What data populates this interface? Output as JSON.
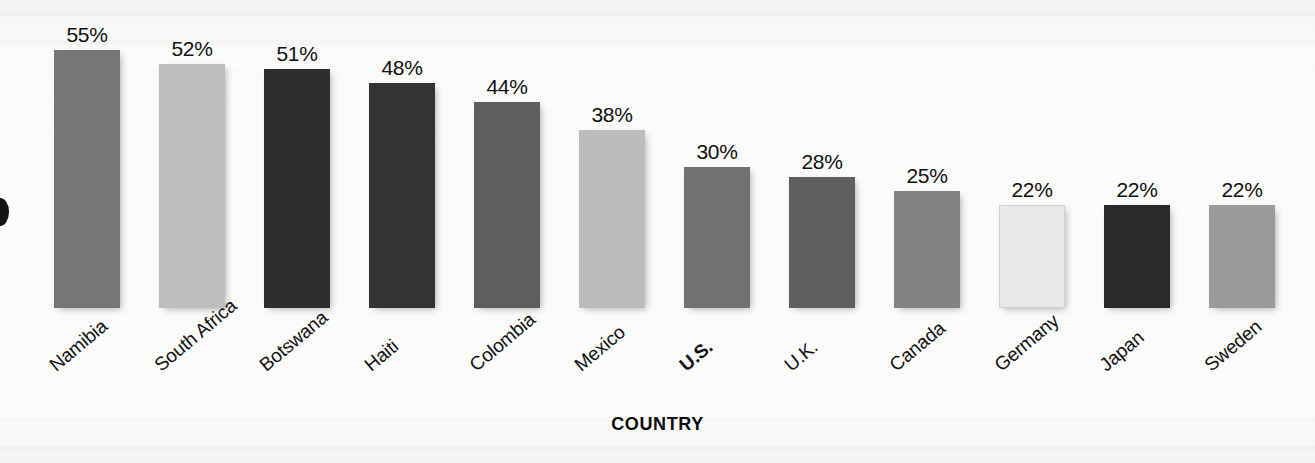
{
  "chart_data": {
    "type": "bar",
    "title": "",
    "subtitle": "",
    "xlabel": "COUNTRY",
    "ylabel": "",
    "ylim": [
      0,
      60
    ],
    "grid": false,
    "legend": null,
    "value_suffix": "%",
    "categories": [
      "Namibia",
      "South Africa",
      "Botswana",
      "Haiti",
      "Colombia",
      "Mexico",
      "U.S.",
      "U.K.",
      "Canada",
      "Germany",
      "Japan",
      "Sweden"
    ],
    "values": [
      55,
      52,
      51,
      48,
      44,
      38,
      30,
      28,
      25,
      22,
      22,
      22
    ],
    "value_labels": [
      "55%",
      "52%",
      "51%",
      "48%",
      "44%",
      "38%",
      "30%",
      "28%",
      "25%",
      "22%",
      "22%",
      "22%"
    ],
    "bar_colors": [
      "#767676",
      "#bdbdbd",
      "#2e2e2e",
      "#333333",
      "#5e5e5e",
      "#bcbcbc",
      "#717171",
      "#5f5f5f",
      "#828282",
      "#e8e8e8",
      "#2a2a2a",
      "#9a9a9a"
    ],
    "highlight_category": "U.S.",
    "bars": [
      {
        "label": "Namibia",
        "value": 55,
        "value_label": "55%",
        "color": "#767676",
        "highlight": false
      },
      {
        "label": "South Africa",
        "value": 52,
        "value_label": "52%",
        "color": "#bdbdbd",
        "highlight": false
      },
      {
        "label": "Botswana",
        "value": 51,
        "value_label": "51%",
        "color": "#2e2e2e",
        "highlight": false
      },
      {
        "label": "Haiti",
        "value": 48,
        "value_label": "48%",
        "color": "#333333",
        "highlight": false
      },
      {
        "label": "Colombia",
        "value": 44,
        "value_label": "44%",
        "color": "#5e5e5e",
        "highlight": false
      },
      {
        "label": "Mexico",
        "value": 38,
        "value_label": "38%",
        "color": "#bcbcbc",
        "highlight": false
      },
      {
        "label": "U.S.",
        "value": 30,
        "value_label": "30%",
        "color": "#717171",
        "highlight": true
      },
      {
        "label": "U.K.",
        "value": 28,
        "value_label": "28%",
        "color": "#5f5f5f",
        "highlight": false
      },
      {
        "label": "Canada",
        "value": 25,
        "value_label": "25%",
        "color": "#828282",
        "highlight": false
      },
      {
        "label": "Germany",
        "value": 22,
        "value_label": "22%",
        "color": "#e8e8e8",
        "highlight": false
      },
      {
        "label": "Japan",
        "value": 22,
        "value_label": "22%",
        "color": "#2a2a2a",
        "highlight": false
      },
      {
        "label": "Sweden",
        "value": 22,
        "value_label": "22%",
        "color": "#9a9a9a",
        "highlight": false
      }
    ]
  },
  "layout": {
    "baseline_y": 308,
    "bar_width": 66,
    "first_bar_left": 54,
    "bar_pitch": 105,
    "px_per_unit": 4.69,
    "label_rotation_deg": -40
  },
  "colors": {
    "text": "#121212",
    "page_background": "#fbfbfa"
  }
}
